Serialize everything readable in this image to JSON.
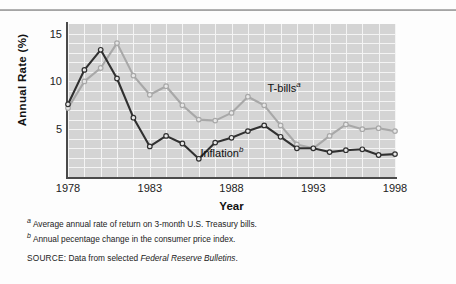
{
  "chart_data": {
    "type": "line",
    "title": "",
    "xlabel": "Year",
    "ylabel": "Annual Rate (%)",
    "xlim": [
      1978,
      1998
    ],
    "ylim": [
      0,
      16
    ],
    "yticks": [
      5,
      10,
      15
    ],
    "xticks": [
      1978,
      1983,
      1988,
      1993,
      1998
    ],
    "grid": true,
    "legend_position": "inline-annotation",
    "x": [
      1978,
      1979,
      1980,
      1981,
      1982,
      1983,
      1984,
      1985,
      1986,
      1987,
      1988,
      1989,
      1990,
      1991,
      1992,
      1993,
      1994,
      1995,
      1996,
      1997,
      1998
    ],
    "series": [
      {
        "name": "T-bills",
        "label": "T-bills",
        "superscript": "a",
        "color": "#a8a8a8",
        "marker": "circle",
        "values": [
          7.2,
          10.0,
          11.4,
          14.0,
          10.6,
          8.6,
          9.5,
          7.5,
          6.0,
          5.9,
          6.7,
          8.4,
          7.5,
          5.4,
          3.4,
          3.0,
          4.3,
          5.5,
          5.0,
          5.1,
          4.8
        ]
      },
      {
        "name": "Inflation",
        "label": "Inflation",
        "superscript": "b",
        "color": "#303030",
        "marker": "circle",
        "values": [
          7.6,
          11.2,
          13.3,
          10.3,
          6.2,
          3.2,
          4.3,
          3.5,
          1.9,
          3.6,
          4.1,
          4.8,
          5.4,
          4.2,
          3.0,
          3.0,
          2.6,
          2.8,
          2.9,
          2.3,
          2.4
        ]
      }
    ]
  },
  "axes": {
    "y_title": "Annual Rate (%)",
    "x_title": "Year",
    "y_tick_labels": [
      "15",
      "10",
      "5"
    ],
    "x_tick_labels": [
      "1978",
      "1983",
      "1988",
      "1993",
      "1998"
    ]
  },
  "annotations": {
    "tbills_label": "T-bills",
    "tbills_sup": "a",
    "inflation_label": "Inflation",
    "inflation_sup": "b"
  },
  "notes": [
    {
      "marker": "a",
      "text": "Average annual rate of return on 3-month U.S. Treasury bills."
    },
    {
      "marker": "b",
      "text": "Annual pecentage change in the consumer price index."
    }
  ],
  "source": {
    "label": "SOURCE:",
    "prefix": " Data from selected ",
    "italic": "Federal Reserve Bulletins",
    "suffix": "."
  }
}
